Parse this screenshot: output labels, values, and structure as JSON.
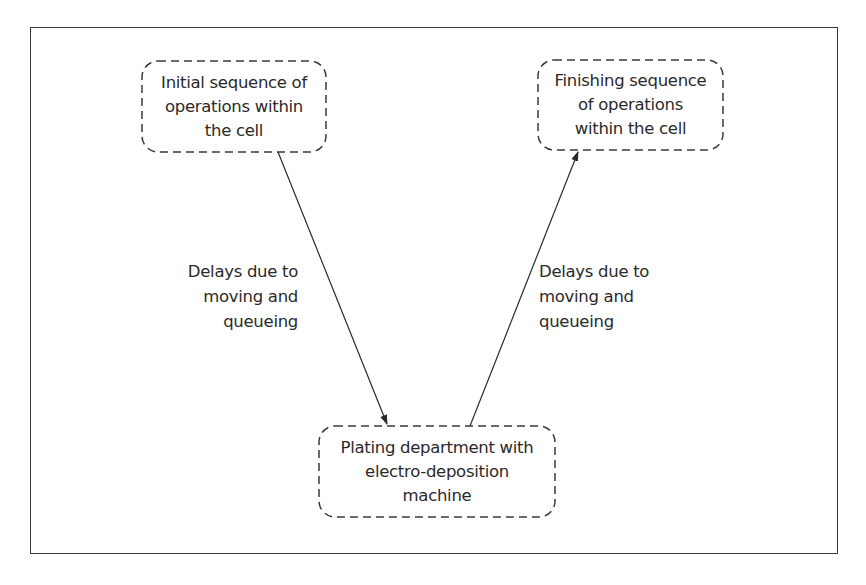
{
  "diagram": {
    "type": "flow",
    "frame": {
      "border_color": "#3a3a3a"
    },
    "nodes": [
      {
        "id": "initial",
        "label": "Initial sequence of\noperations within\nthe cell"
      },
      {
        "id": "finishing",
        "label": "Finishing sequence\nof operations\nwithin the cell"
      },
      {
        "id": "plating",
        "label": "Plating department with\nelectro-deposition\nmachine"
      }
    ],
    "edges": [
      {
        "from": "initial",
        "to": "plating",
        "label": "Delays due to\nmoving and\nqueueing"
      },
      {
        "from": "plating",
        "to": "finishing",
        "label": "Delays due to\nmoving and\nqueueing"
      }
    ]
  }
}
